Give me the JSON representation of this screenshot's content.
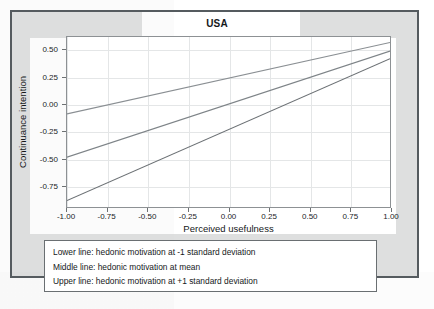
{
  "figure": {
    "title": "USA"
  },
  "chart_data": {
    "type": "line",
    "title": "USA",
    "xlabel": "Perceived usefulness",
    "ylabel": "Continuance intention",
    "xlim": [
      -1.0,
      1.0
    ],
    "ylim": [
      -0.95,
      0.62
    ],
    "xticks": [
      "-1.00",
      "-0.75",
      "-0.50",
      "-0.25",
      "0.00",
      "0.25",
      "0.50",
      "0.75",
      "1.00"
    ],
    "xtick_values": [
      -1.0,
      -0.75,
      -0.5,
      -0.25,
      0.0,
      0.25,
      0.5,
      0.75,
      1.0
    ],
    "yticks": [
      "0.50",
      "0.25",
      "0.00",
      "-0.25",
      "-0.50",
      "-0.75"
    ],
    "ytick_values": [
      0.5,
      0.25,
      0.0,
      -0.25,
      -0.5,
      -0.75
    ],
    "grid": true,
    "legend_position": "below-plot-note-box",
    "x": [
      -1.0,
      1.0
    ],
    "series": [
      {
        "name": "Upper line: hedonic motivation at +1 standard deviation",
        "values": [
          -0.09,
          0.57
        ],
        "color": "#8a8f93",
        "slope": 0.33,
        "intercept": 0.24
      },
      {
        "name": "Middle line: hedonic motivation at mean",
        "values": [
          -0.49,
          0.49
        ],
        "color": "#7e8488",
        "slope": 0.49,
        "intercept": 0.0
      },
      {
        "name": "Lower line: hedonic motivation at -1 standard deviation",
        "values": [
          -0.89,
          0.42
        ],
        "color": "#6b7074",
        "slope": 0.655,
        "intercept": -0.235
      }
    ],
    "annotations": [
      "Lower line: hedonic motivation at -1 standard deviation",
      "Middle line: hedonic motivation at  mean",
      "Upper line: hedonic motivation at +1 standard deviation"
    ]
  },
  "note_box": {
    "lines": [
      "Lower line: hedonic motivation at -1 standard deviation",
      "Middle line: hedonic motivation at  mean",
      "Upper line: hedonic motivation at +1 standard deviation"
    ]
  },
  "colors": {
    "figure_border": "#555b5f",
    "plot_border": "#8d9194",
    "grid": "#e4e6e7",
    "text": "#15181a",
    "note_border": "#6a6f72"
  }
}
